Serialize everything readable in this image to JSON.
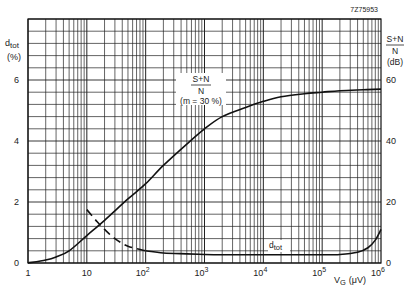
{
  "figure_id": "7Z75953",
  "left_axis": {
    "label_main": "d",
    "label_sub": "tot",
    "unit": "(%)",
    "ticks": [
      "0",
      "2",
      "4",
      "6"
    ]
  },
  "right_axis": {
    "label_num": "S+N",
    "label_den": "N",
    "unit": "(dB)",
    "ticks": [
      "0",
      "20",
      "40",
      "60"
    ]
  },
  "x_axis": {
    "label_main": "V",
    "label_sub": "G",
    "unit": "(μV)",
    "ticks": [
      {
        "base": "1",
        "exp": ""
      },
      {
        "base": "10",
        "exp": ""
      },
      {
        "base": "10",
        "exp": "2"
      },
      {
        "base": "10",
        "exp": "3"
      },
      {
        "base": "10",
        "exp": "4"
      },
      {
        "base": "10",
        "exp": "5"
      },
      {
        "base": "10",
        "exp": "6"
      }
    ]
  },
  "annotations": {
    "snr_num": "S+N",
    "snr_den": "N",
    "snr_cond": "(m = 30 %)",
    "dtot_main": "d",
    "dtot_sub": "tot"
  },
  "chart_data": {
    "type": "line",
    "title": "",
    "xlabel": "VG (μV)",
    "xscale": "log",
    "xlim": [
      1,
      1000000
    ],
    "ylabel_left": "dtot (%)",
    "ylim_left": [
      0,
      8
    ],
    "ylabel_right": "(S+N)/N (dB)",
    "ylim_right": [
      0,
      80
    ],
    "grid": true,
    "series": [
      {
        "name": "(S+N)/N (m = 30 %)",
        "axis": "right",
        "style": "solid",
        "x": [
          1,
          2,
          3,
          5,
          10,
          20,
          50,
          100,
          200,
          500,
          1000,
          2000,
          5000,
          10000,
          20000,
          50000,
          100000,
          200000,
          500000,
          1000000
        ],
        "y": [
          0,
          1,
          2,
          4,
          9,
          14,
          21,
          26,
          32,
          39,
          44,
          48,
          51,
          53,
          54.5,
          55.5,
          56,
          56.5,
          56.8,
          57
        ]
      },
      {
        "name": "dtot (dashed region)",
        "axis": "left",
        "style": "dashed",
        "x": [
          10,
          15,
          20,
          30,
          50,
          100
        ],
        "y": [
          1.75,
          1.35,
          1.1,
          0.8,
          0.55,
          0.4
        ]
      },
      {
        "name": "dtot",
        "axis": "left",
        "style": "solid",
        "x": [
          100,
          200,
          500,
          1000,
          2000,
          5000,
          10000,
          50000,
          100000,
          200000,
          400000,
          600000,
          800000,
          1000000
        ],
        "y": [
          0.4,
          0.33,
          0.3,
          0.28,
          0.27,
          0.27,
          0.27,
          0.27,
          0.27,
          0.28,
          0.35,
          0.5,
          0.75,
          1.1
        ]
      }
    ]
  }
}
